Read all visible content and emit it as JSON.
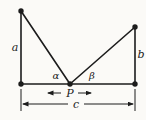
{
  "figure": {
    "labels": {
      "side_a": "a",
      "side_b": "b",
      "base_c": "c",
      "point_p": "P",
      "angle_alpha": "α",
      "angle_beta": "β"
    },
    "colors": {
      "line": "#1c1c1c",
      "background": "#fbfaf7"
    }
  }
}
